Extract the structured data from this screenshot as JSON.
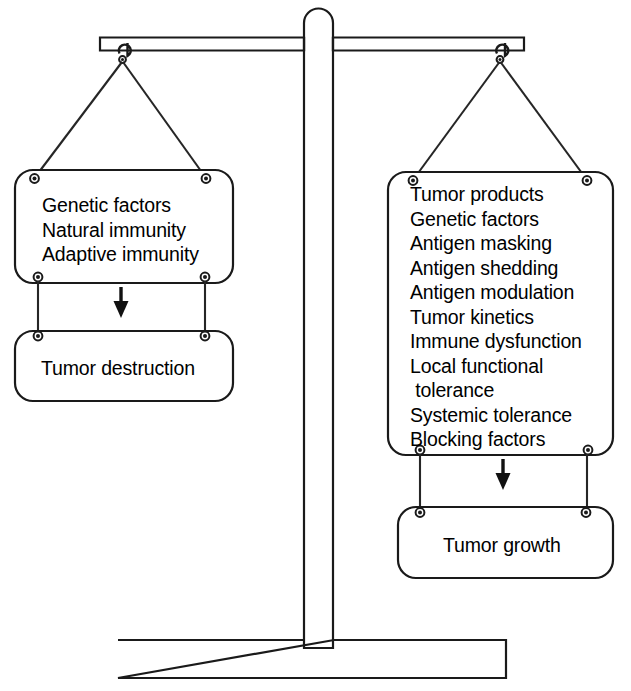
{
  "diagram": {
    "type": "balance-scale",
    "colors": {
      "stroke": "#1a1a1a",
      "background": "#ffffff",
      "text": "#000000",
      "arrow": "#111111"
    },
    "left_pan": {
      "name": "tumor-destruction-pan",
      "items": [
        "Genetic factors",
        "Natural immunity",
        "Adaptive immunity"
      ],
      "outcome": "Tumor destruction",
      "arrow": "down-arrow"
    },
    "right_pan": {
      "name": "tumor-growth-pan",
      "items": [
        "Tumor products",
        "Genetic factors",
        "Antigen masking",
        "Antigen shedding",
        "Antigen modulation",
        "Tumor kinetics",
        "Immune dysfunction",
        "Local functional",
        " tolerance",
        "Systemic tolerance",
        "Blocking factors"
      ],
      "outcome": "Tumor growth",
      "arrow": "down-arrow"
    },
    "structure": {
      "beam": "balance-beam",
      "post": "balance-post",
      "base": "balance-base",
      "left_hook": "left-hook",
      "right_hook": "right-hook"
    }
  }
}
